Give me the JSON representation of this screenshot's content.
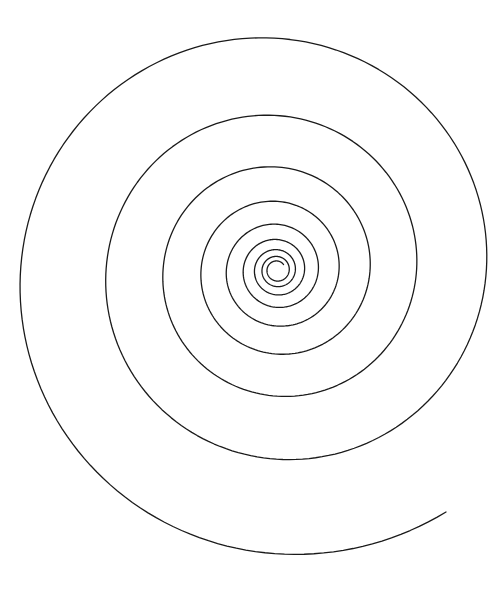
{
  "canvas": {
    "width": 504,
    "height": 589,
    "background": "#ffffff"
  },
  "figure": {
    "type": "logarithmic-spiral",
    "stroke_color": "#1a1a1a",
    "stroke_width": 1.3,
    "center": [
      277,
      270
    ],
    "growth_per_turn": 1.5,
    "direction": "counterclockwise-outward",
    "inner_end": [
      280,
      262
    ],
    "outer_end": [
      446,
      512
    ],
    "outer_end_radius": 295
  }
}
